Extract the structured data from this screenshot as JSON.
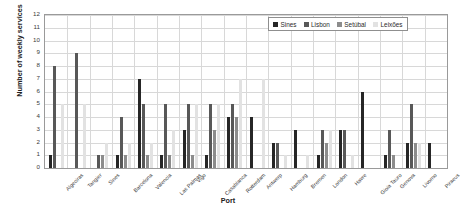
{
  "chart_data": {
    "type": "bar",
    "title": "",
    "xlabel": "Port",
    "ylabel": "Number of weekly services",
    "ylim": [
      0,
      12
    ],
    "ytick_labels": [
      "0",
      "1",
      "2",
      "3",
      "4",
      "5",
      "6",
      "7",
      "8",
      "9",
      "10",
      "11",
      "12"
    ],
    "grid": true,
    "legend_position": "top-right",
    "categories": [
      "Algeciras",
      "Tangier",
      "Sines",
      "Barcelona",
      "Valencia",
      "Las Palmas",
      "Vigo",
      "Casablanca",
      "Rotterdam",
      "Antwerp",
      "Hamburg",
      "Bremen",
      "London",
      "Havre",
      "Gioia Tauro",
      "Genova",
      "Livorno",
      "Piraeus"
    ],
    "series": [
      {
        "name": "Sines",
        "color": "#262626",
        "values": [
          1,
          0,
          0,
          1,
          7,
          1,
          3,
          1,
          4,
          4,
          2,
          3,
          1,
          3,
          6,
          1,
          2,
          2
        ]
      },
      {
        "name": "Lisbon",
        "color": "#585858",
        "values": [
          8,
          9,
          1,
          4,
          5,
          5,
          5,
          5,
          5,
          0,
          2,
          0,
          3,
          3,
          0,
          3,
          5,
          0
        ]
      },
      {
        "name": "Setúbal",
        "color": "#8c8c8c",
        "values": [
          0,
          0,
          1,
          1,
          1,
          1,
          1,
          3,
          4,
          0,
          0,
          0,
          2,
          0,
          0,
          1,
          2,
          0
        ]
      },
      {
        "name": "Leixões",
        "color": "#e2e2e2",
        "values": [
          5,
          5,
          2,
          2,
          2,
          3,
          5,
          5,
          7,
          7,
          1,
          1,
          3,
          1,
          0,
          0,
          2,
          0
        ]
      }
    ]
  },
  "legend": {
    "items": [
      {
        "label": "Sines",
        "color": "#262626"
      },
      {
        "label": "Lisbon",
        "color": "#585858"
      },
      {
        "label": "Setúbal",
        "color": "#8c8c8c"
      },
      {
        "label": "Leixões",
        "color": "#e2e2e2"
      }
    ]
  },
  "axes": {
    "y_title": "Number of weekly services",
    "x_title": "Port"
  }
}
